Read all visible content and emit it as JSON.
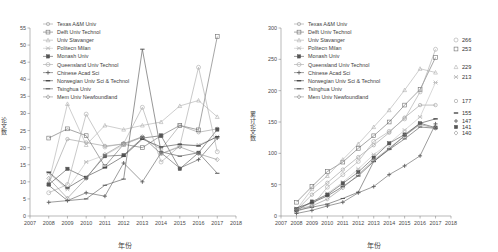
{
  "figure": {
    "panels": [
      "left-annual",
      "right-cumulative"
    ],
    "x_axis_title": "年份",
    "left_y_axis_title": "论文数",
    "right_y_axis_title": "累计论文数"
  },
  "legend": {
    "position": "top-left inside plot",
    "items": [
      {
        "label": "Texas A&M Univ",
        "marker": "circle-open",
        "color": "#9b9b9b"
      },
      {
        "label": "Delft Univ Technol",
        "marker": "square-open",
        "color": "#6f6f6f"
      },
      {
        "label": "Univ Stavanger",
        "marker": "triangle-open",
        "color": "#b0b0b0"
      },
      {
        "label": "Politecn Milan",
        "marker": "cross-x",
        "color": "#c2c2c2"
      },
      {
        "label": "Monash Univ",
        "marker": "square-filled",
        "color": "#555555"
      },
      {
        "label": "Queensland Univ Technol",
        "marker": "circle-open-lg",
        "color": "#a8a8a8"
      },
      {
        "label": "Chinese Acad Sci",
        "marker": "plus",
        "color": "#606060"
      },
      {
        "label": "Norwegian Univ Sci & Technol",
        "marker": "dash",
        "color": "#4a4a4a"
      },
      {
        "label": "Tsinghua Univ",
        "marker": "line",
        "color": "#565656"
      },
      {
        "label": "Mem Univ Newfoundland",
        "marker": "diamond-open",
        "color": "#8e8e8e"
      }
    ]
  },
  "chart_data": [
    {
      "type": "line",
      "title": "",
      "xlabel": "年份",
      "ylabel": "论文数",
      "xlim": [
        2007,
        2018
      ],
      "ylim": [
        0,
        55
      ],
      "ytick_step": 5,
      "grid": false,
      "legend_position": "upper-left",
      "x": [
        2008,
        2009,
        2010,
        2011,
        2012,
        2013,
        2014,
        2015,
        2016,
        2017
      ],
      "xticks": [
        2007,
        2008,
        2009,
        2010,
        2011,
        2012,
        2013,
        2014,
        2015,
        2016,
        2017,
        2018
      ],
      "yticks": [
        0,
        5,
        10,
        15,
        20,
        25,
        30,
        35,
        40,
        45,
        50,
        55
      ],
      "series": [
        {
          "name": "Texas A&M Univ",
          "values": [
            9.5,
            22.5,
            21.5,
            20.5,
            21,
            23,
            19.5,
            26.5,
            24.5,
            25.5
          ]
        },
        {
          "name": "Delft Univ Technol",
          "values": [
            22.8,
            25.5,
            23.5,
            14.5,
            21,
            20,
            23.5,
            26.5,
            25.2,
            52.5
          ]
        },
        {
          "name": "Univ Stavanger",
          "values": [
            9.8,
            32.8,
            20.8,
            26.5,
            25.3,
            26.5,
            27.5,
            32.2,
            33.8,
            29
          ]
        },
        {
          "name": "Politecn Milan",
          "values": [
            12.5,
            7.8,
            15.8,
            17.8,
            20.8,
            23.2,
            18.2,
            20.5,
            20.8,
            23.2
          ]
        },
        {
          "name": "Monash Univ",
          "values": [
            9.2,
            13.8,
            11.2,
            17.5,
            17.8,
            22.8,
            23.5,
            13.8,
            18.5,
            25.3
          ]
        },
        {
          "name": "Queensland Univ Technol",
          "values": [
            6.8,
            9.2,
            29.8,
            20.2,
            21.2,
            31.8,
            15.8,
            20.5,
            43.5,
            18.8
          ]
        },
        {
          "name": "Chinese Acad Sci",
          "values": [
            4,
            4.5,
            6.8,
            5.8,
            15.5,
            10,
            18.5,
            14,
            16.5,
            22.8
          ]
        },
        {
          "name": "Norwegian Univ Sci & Technol",
          "values": [
            12.8,
            8.2,
            11.5,
            14.2,
            17.5,
            22.5,
            20.2,
            21,
            20.5,
            23.2
          ]
        },
        {
          "name": "Tsinghua Univ",
          "values": [
            9,
            4.5,
            5,
            9,
            10.8,
            48.8,
            18.8,
            17.5,
            18.5,
            12.5
          ]
        },
        {
          "name": "Mem Univ Newfoundland",
          "values": [
            11,
            5.2,
            11,
            18,
            21.2,
            23.2,
            18.2,
            20.2,
            18.2,
            16.5
          ]
        }
      ]
    },
    {
      "type": "line",
      "title": "",
      "xlabel": "年份",
      "ylabel": "累计论文数",
      "xlim": [
        2007,
        2018
      ],
      "ylim": [
        0,
        300
      ],
      "ytick_step": 50,
      "grid": false,
      "legend_position": "upper-left",
      "x": [
        2008,
        2009,
        2010,
        2011,
        2012,
        2013,
        2014,
        2015,
        2016,
        2017
      ],
      "xticks": [
        2007,
        2008,
        2009,
        2010,
        2011,
        2012,
        2013,
        2014,
        2015,
        2016,
        2017,
        2018
      ],
      "yticks": [
        0,
        50,
        100,
        150,
        200,
        250,
        300
      ],
      "end_labels": [
        {
          "series": "Queensland Univ Technol",
          "value": "266",
          "marker": "circle-open-lg"
        },
        {
          "series": "Delft Univ Technol",
          "value": "253",
          "marker": "square-open"
        },
        {
          "series": "Univ Stavanger",
          "value": "229",
          "marker": "triangle-open"
        },
        {
          "series": "Politecn Milan",
          "value": "213",
          "marker": "cross-x"
        },
        {
          "series": "Texas A&M Univ",
          "value": "177",
          "marker": "circle-open"
        },
        {
          "series": "Norwegian Univ Sci & Technol",
          "value": "155",
          "marker": "dash"
        },
        {
          "series": "Chinese Acad Sci",
          "value": "147",
          "marker": "plus"
        },
        {
          "series": "Monash Univ",
          "value": "141",
          "marker": "square-filled"
        },
        {
          "series": "Mem Univ Newfoundland",
          "value": "140",
          "marker": "diamond-open"
        }
      ],
      "series": [
        {
          "name": "Texas A&M Univ",
          "values": [
            9,
            34,
            53,
            74,
            94,
            113,
            133,
            157,
            177,
            177
          ]
        },
        {
          "name": "Delft Univ Technol",
          "values": [
            22,
            47,
            71,
            86,
            108,
            128,
            150,
            177,
            202,
            253
          ]
        },
        {
          "name": "Univ Stavanger",
          "values": [
            10,
            43,
            64,
            90,
            115,
            142,
            169,
            201,
            235,
            229
          ]
        },
        {
          "name": "Politecn Milan",
          "values": [
            12,
            20,
            36,
            54,
            75,
            98,
            116,
            137,
            158,
            213
          ]
        },
        {
          "name": "Monash Univ",
          "values": [
            9,
            23,
            34,
            52,
            70,
            93,
            116,
            130,
            148,
            141
          ]
        },
        {
          "name": "Queensland Univ Technol",
          "values": [
            7,
            16,
            46,
            66,
            87,
            119,
            135,
            155,
            198,
            266
          ]
        },
        {
          "name": "Chinese Acad Sci",
          "values": [
            4,
            9,
            16,
            22,
            37,
            47,
            66,
            80,
            96,
            147
          ]
        },
        {
          "name": "Norwegian Univ Sci & Technol",
          "values": [
            13,
            21,
            32,
            47,
            64,
            87,
            107,
            128,
            148,
            155
          ]
        },
        {
          "name": "Tsinghua Univ",
          "values": [
            9,
            14,
            19,
            28,
            38,
            87,
            106,
            123,
            142,
            140
          ]
        },
        {
          "name": "Mem Univ Newfoundland",
          "values": [
            11,
            16,
            27,
            45,
            66,
            89,
            108,
            128,
            146,
            140
          ]
        }
      ]
    }
  ]
}
